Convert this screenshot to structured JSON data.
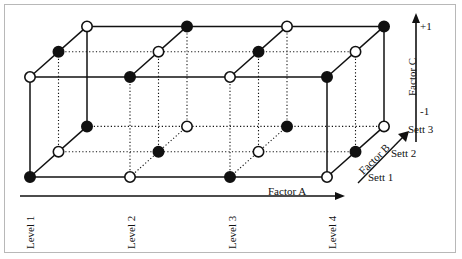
{
  "figure": {
    "type": "3d-factorial-design-cube",
    "axes": {
      "factor_a": {
        "label": "Factor A",
        "levels": [
          "Level 1",
          "Level 2",
          "Level 3",
          "Level 4"
        ]
      },
      "factor_b": {
        "label": "Factor B",
        "levels": [
          "Sett 1",
          "Sett 2",
          "Sett 3"
        ]
      },
      "factor_c": {
        "label": "Factor C",
        "ticks": [
          "+1",
          "-1"
        ]
      }
    }
  },
  "chart_data": {
    "type": "scatter",
    "title": "",
    "xlabel": "Factor A",
    "ylabel": "Factor C",
    "zlabel": "Factor B",
    "grid": true,
    "legend": "none",
    "x_categories": [
      "Level 1",
      "Level 2",
      "Level 3",
      "Level 4"
    ],
    "z_categories": [
      "Sett 1",
      "Sett 2",
      "Sett 3"
    ],
    "y_categories": [
      "-1",
      "+1"
    ],
    "marker_encoding": {
      "filled": "black filled circle",
      "open": "white open circle"
    },
    "note": "Nodes alternate filled/open by parity of (a + b + c) index sum",
    "points": [
      {
        "a": 1,
        "b": 1,
        "c": 1,
        "marker": "filled"
      },
      {
        "a": 2,
        "b": 1,
        "c": 1,
        "marker": "open"
      },
      {
        "a": 3,
        "b": 1,
        "c": 1,
        "marker": "filled"
      },
      {
        "a": 4,
        "b": 1,
        "c": 1,
        "marker": "open"
      },
      {
        "a": 1,
        "b": 2,
        "c": 1,
        "marker": "open"
      },
      {
        "a": 2,
        "b": 2,
        "c": 1,
        "marker": "filled"
      },
      {
        "a": 3,
        "b": 2,
        "c": 1,
        "marker": "open"
      },
      {
        "a": 4,
        "b": 2,
        "c": 1,
        "marker": "filled"
      },
      {
        "a": 1,
        "b": 3,
        "c": 1,
        "marker": "filled"
      },
      {
        "a": 2,
        "b": 3,
        "c": 1,
        "marker": "open"
      },
      {
        "a": 3,
        "b": 3,
        "c": 1,
        "marker": "filled"
      },
      {
        "a": 4,
        "b": 3,
        "c": 1,
        "marker": "open"
      },
      {
        "a": 1,
        "b": 1,
        "c": 2,
        "marker": "open"
      },
      {
        "a": 2,
        "b": 1,
        "c": 2,
        "marker": "filled"
      },
      {
        "a": 3,
        "b": 1,
        "c": 2,
        "marker": "open"
      },
      {
        "a": 4,
        "b": 1,
        "c": 2,
        "marker": "filled"
      },
      {
        "a": 1,
        "b": 2,
        "c": 2,
        "marker": "filled"
      },
      {
        "a": 2,
        "b": 2,
        "c": 2,
        "marker": "open"
      },
      {
        "a": 3,
        "b": 2,
        "c": 2,
        "marker": "filled"
      },
      {
        "a": 4,
        "b": 2,
        "c": 2,
        "marker": "open"
      },
      {
        "a": 1,
        "b": 3,
        "c": 2,
        "marker": "open"
      },
      {
        "a": 2,
        "b": 3,
        "c": 2,
        "marker": "filled"
      },
      {
        "a": 3,
        "b": 3,
        "c": 2,
        "marker": "open"
      },
      {
        "a": 4,
        "b": 3,
        "c": 2,
        "marker": "filled"
      }
    ]
  },
  "labels": {
    "factor_a": "Factor A",
    "factor_b": "Factor B",
    "factor_c": "Factor C",
    "tick_plus_one": "+1",
    "tick_minus_one": "-1",
    "level_1": "Level 1",
    "level_2": "Level 2",
    "level_3": "Level 3",
    "level_4": "Level 4",
    "sett_1": "Sett 1",
    "sett_2": "Sett 2",
    "sett_3": "Sett 3"
  }
}
